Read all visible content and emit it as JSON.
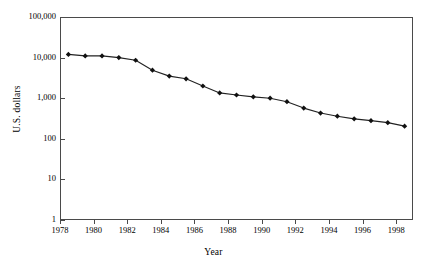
{
  "chart_data": {
    "type": "line",
    "title": "",
    "xlabel": "Year",
    "ylabel": "U.S. dollars",
    "yscale": "log",
    "ylim": [
      1,
      100000
    ],
    "xlim": [
      1978,
      1999
    ],
    "grid": false,
    "legend": null,
    "y_tick_labels": [
      "100,000",
      "10,000",
      "1,000",
      "100",
      "10",
      "1"
    ],
    "y_tick_values": [
      100000,
      10000,
      1000,
      100,
      10,
      1
    ],
    "x_tick_labels": [
      "1978",
      "1980",
      "1982",
      "1984",
      "1986",
      "1988",
      "1990",
      "1992",
      "1994",
      "1996",
      "1998"
    ],
    "x_tick_values": [
      1978,
      1980,
      1982,
      1984,
      1986,
      1988,
      1990,
      1992,
      1994,
      1996,
      1998
    ],
    "series": [
      {
        "name": "U.S. dollars",
        "marker": "diamond",
        "color": "#111111",
        "x": [
          1978.5,
          1979.5,
          1980.5,
          1981.5,
          1982.5,
          1983.5,
          1984.5,
          1985.5,
          1986.5,
          1987.5,
          1988.5,
          1989.5,
          1990.5,
          1991.5,
          1992.5,
          1993.5,
          1994.5,
          1995.5,
          1996.5,
          1997.5,
          1998.5
        ],
        "values": [
          12000,
          11000,
          11000,
          10000,
          8600,
          4900,
          3500,
          3000,
          2000,
          1350,
          1200,
          1080,
          1000,
          820,
          570,
          430,
          360,
          310,
          280,
          250,
          205
        ]
      }
    ]
  }
}
